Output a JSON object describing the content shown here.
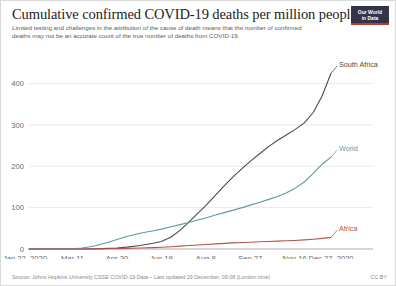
{
  "header": {
    "title": "Cumulative confirmed COVID-19 deaths per million people",
    "subtitle": "Limited testing and challenges in the attribution of the cause of death means that the number of confirmed deaths may not be an accurate count of the true number of deaths from COVID-19.",
    "logo_line1": "Our World",
    "logo_line2": "in Data"
  },
  "footer": {
    "source": "Source: Johns Hopkins University CSSE COVID-19 Data – Last updated 29 December, 09:08 (London time)",
    "license": "CC BY"
  },
  "colors": {
    "south_africa": "#4c4c4c",
    "world": "#5d9aa6",
    "africa": "#b5564a",
    "grid": "#e0e0e0",
    "axis_text": "#6a6a6a",
    "logo_bg": "#33334c",
    "logo_accent": "#c0392b"
  },
  "chart_data": {
    "type": "line",
    "title": "Cumulative confirmed COVID-19 deaths per million people",
    "subtitle": "Limited testing and challenges in the attribution of the cause of death means that the number of confirmed deaths may not be an accurate count of the true number of deaths from COVID-19.",
    "xlabel": "",
    "ylabel": "",
    "ylim": [
      0,
      440
    ],
    "yticks": [
      0,
      100,
      200,
      300,
      400
    ],
    "ytick_labels": [
      "0",
      "100",
      "200",
      "300",
      "400"
    ],
    "xticks": [
      "Jan 22, 2020",
      "Mar 11",
      "Apr 30",
      "Jun 19",
      "Aug 8",
      "Sep 27",
      "Nov 16",
      "Dec 27, 2020"
    ],
    "xtick_positions": [
      0,
      49,
      99,
      149,
      199,
      249,
      299,
      340
    ],
    "x_unit": "days since Jan 22, 2020",
    "grid": true,
    "legend_position": "line-end-labels",
    "series": [
      {
        "name": "South Africa",
        "color": "#4c4c4c",
        "x": [
          0,
          20,
          40,
          49,
          60,
          75,
          90,
          99,
          110,
          125,
          140,
          149,
          160,
          170,
          180,
          190,
          199,
          210,
          220,
          230,
          240,
          249,
          260,
          270,
          280,
          290,
          299,
          310,
          320,
          330,
          340
        ],
        "values": [
          0,
          0,
          0,
          0,
          0.1,
          0.5,
          1.6,
          2.5,
          4.5,
          8.5,
          14,
          18,
          29,
          45,
          65,
          86,
          105,
          130,
          153,
          175,
          195,
          212,
          231,
          248,
          263,
          276,
          288,
          305,
          330,
          370,
          425
        ]
      },
      {
        "name": "World",
        "color": "#5d9aa6",
        "x": [
          0,
          20,
          40,
          49,
          60,
          75,
          90,
          99,
          110,
          125,
          140,
          149,
          160,
          170,
          180,
          190,
          199,
          210,
          220,
          230,
          240,
          249,
          260,
          270,
          280,
          290,
          299,
          310,
          320,
          330,
          340
        ],
        "values": [
          0,
          0.1,
          0.3,
          0.7,
          2.5,
          8,
          17,
          23,
          30,
          38,
          44,
          48,
          54,
          59,
          64,
          70,
          75,
          82,
          88,
          94,
          100,
          106,
          113,
          120,
          127,
          136,
          146,
          162,
          183,
          205,
          222
        ]
      },
      {
        "name": "Africa",
        "color": "#b5564a",
        "x": [
          0,
          20,
          40,
          49,
          60,
          75,
          90,
          99,
          110,
          125,
          140,
          149,
          160,
          170,
          180,
          190,
          199,
          210,
          220,
          230,
          240,
          249,
          260,
          270,
          280,
          290,
          299,
          310,
          320,
          330,
          340
        ],
        "values": [
          0,
          0,
          0,
          0,
          0.1,
          0.3,
          0.6,
          0.9,
          1.4,
          2.3,
          3.4,
          4.2,
          5.6,
          7.0,
          8.4,
          9.8,
          11.0,
          12.4,
          13.6,
          14.7,
          15.7,
          16.5,
          17.4,
          18.2,
          19.0,
          19.8,
          20.7,
          22.0,
          23.6,
          25.6,
          28.0
        ]
      }
    ],
    "end_labels": [
      {
        "name": "South Africa",
        "color": "#4c4c4c"
      },
      {
        "name": "World",
        "color": "#5d9aa6"
      },
      {
        "name": "Africa",
        "color": "#b5564a"
      }
    ]
  }
}
